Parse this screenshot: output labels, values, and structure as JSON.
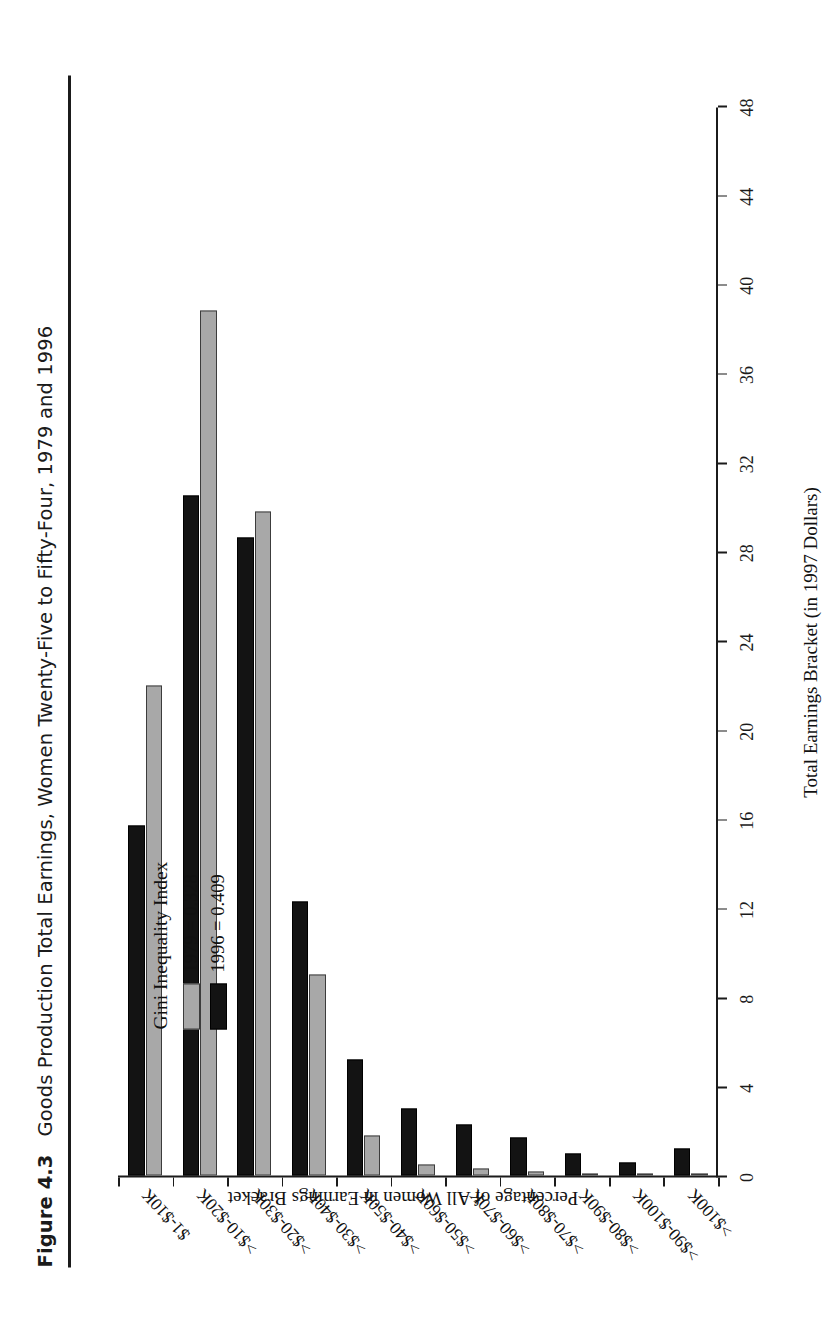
{
  "caption": {
    "figure_number": "Figure 4.3",
    "text": "Goods Production Total Earnings, Women Twenty-Five to Fifty-Four, 1979 and 1996"
  },
  "legend": {
    "title": "Gini Inequality Index",
    "entries": [
      {
        "label": "1979 = 0.328",
        "color": "#a8a8a8"
      },
      {
        "label": "1996 = 0.409",
        "color": "#131313"
      }
    ]
  },
  "axis_titles": {
    "x": "Total Earnings Bracket (in 1997 Dollars)",
    "y": "Percentage of All Women in Earnings Bracket"
  },
  "chart_data": {
    "type": "bar",
    "title": "Goods Production Total Earnings, Women Twenty-Five to Fifty-Four, 1979 and 1996",
    "xlabel": "Total Earnings Bracket (in 1997 Dollars)",
    "ylabel": "Percentage of All Women in Earnings Bracket",
    "ylim": [
      0,
      48
    ],
    "yticks": [
      0,
      4,
      8,
      12,
      16,
      20,
      24,
      28,
      32,
      36,
      40,
      44,
      48
    ],
    "grid": false,
    "legend_position": "upper-right",
    "orientation": "vertical",
    "categories": [
      "$1-$10K",
      ">$10-$20K",
      ">$20-$30K",
      ">$30-$40K",
      ">$40-$50K",
      ">$50-$60K",
      ">$60-$70K",
      ">$70-$80K",
      ">$80-$90K",
      ">$90-$100K",
      ">$100K"
    ],
    "series": [
      {
        "name": "1979 = 0.328",
        "color": "#a8a8a8",
        "values": [
          22.0,
          38.8,
          29.8,
          9.0,
          1.8,
          0.5,
          0.3,
          0.2,
          0.1,
          0.05,
          0.1
        ]
      },
      {
        "name": "1996 = 0.409",
        "color": "#131313",
        "values": [
          15.7,
          30.5,
          28.6,
          12.3,
          5.2,
          3.0,
          2.3,
          1.7,
          1.0,
          0.6,
          1.2
        ]
      }
    ]
  }
}
